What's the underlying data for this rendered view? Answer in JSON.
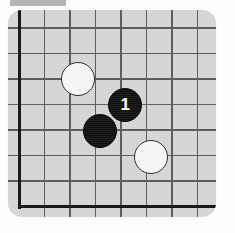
{
  "diagram": {
    "kind": "go-board-corner-diagram",
    "board": {
      "background_color": "#d6d6d6",
      "grid_line_color": "#4a4a4a",
      "edge_line_color": "#111111",
      "grid_spacing_px": 25.5,
      "panel": {
        "x": 8,
        "y": 10,
        "width": 208,
        "height": 207,
        "corner_radius": 14
      },
      "edges": {
        "left_x": 19,
        "bottom_y": 196
      },
      "grid_vertical_x": [
        19,
        44.5,
        70,
        95.5,
        121,
        146.5,
        172,
        197.5
      ],
      "grid_horizontal_y": [
        18,
        43.5,
        69,
        94.5,
        120,
        145.5,
        171,
        196
      ]
    },
    "top_bar": {
      "color": "#b4b4b4",
      "x": 10,
      "y": 0,
      "width": 56,
      "height": 6
    },
    "stones": [
      {
        "id": "white-stone-upper-left",
        "color": "white",
        "label": "",
        "cx": 78,
        "cy": 79,
        "r": 17
      },
      {
        "id": "black-stone-move-1",
        "color": "black",
        "label": "1",
        "cx": 125,
        "cy": 105,
        "r": 17
      },
      {
        "id": "black-stone-lower-left",
        "color": "black",
        "label": "",
        "cx": 100,
        "cy": 131,
        "r": 17
      },
      {
        "id": "white-stone-lower-right",
        "color": "white",
        "label": "",
        "cx": 151,
        "cy": 157,
        "r": 17
      }
    ]
  }
}
